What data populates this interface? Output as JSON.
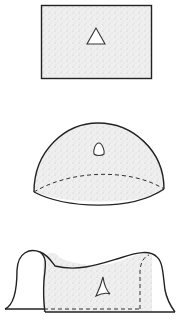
{
  "diagram": {
    "panels": [
      {
        "id": "flat",
        "shape": "rectangle-plane",
        "triangle": "straight-sided triangle"
      },
      {
        "id": "spherical",
        "shape": "hemisphere",
        "triangle": "bulging triangle"
      },
      {
        "id": "hyperbolic",
        "shape": "saddle surface",
        "triangle": "concave triangle"
      }
    ],
    "colors": {
      "stroke": "#222222",
      "fill_stipple": "#e4e4e4",
      "background": "#ffffff"
    }
  }
}
